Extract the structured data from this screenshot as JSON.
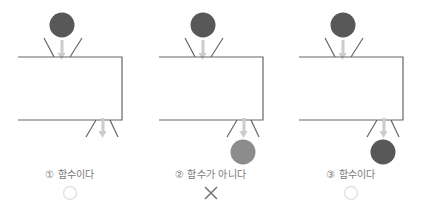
{
  "figure": {
    "colors": {
      "outline": "#666666",
      "arrow": "#cccccc",
      "ball_dark": "#585858",
      "ball_light": "#8c8c8c",
      "caption_text": "#7a7a7a",
      "mark_circle": "#e2e2e2",
      "mark_cross": "#777777",
      "background": "#ffffff"
    }
  },
  "panels": [
    {
      "index": "①",
      "label": "① 함수이다",
      "verdict_mark": "circle",
      "verdict_name": "O",
      "input_ball": {
        "shown": true,
        "shade": "dark"
      },
      "output_ball": {
        "shown": false,
        "shade": null
      },
      "in_arrow": true,
      "out_arrow": true
    },
    {
      "index": "②",
      "label": "② 함수가 아니다",
      "verdict_mark": "cross",
      "verdict_name": "X",
      "input_ball": {
        "shown": true,
        "shade": "dark"
      },
      "output_ball": {
        "shown": true,
        "shade": "light"
      },
      "in_arrow": true,
      "out_arrow": true
    },
    {
      "index": "③",
      "label": "③ 함수이다",
      "verdict_mark": "circle",
      "verdict_name": "O",
      "input_ball": {
        "shown": true,
        "shade": "dark"
      },
      "output_ball": {
        "shown": true,
        "shade": "dark"
      },
      "in_arrow": true,
      "out_arrow": true
    }
  ]
}
